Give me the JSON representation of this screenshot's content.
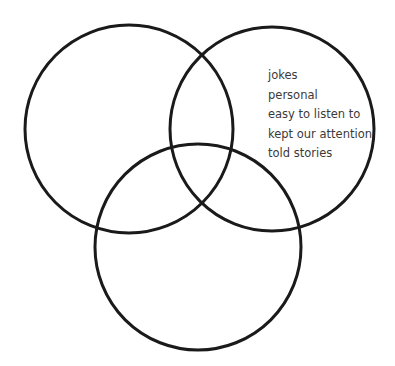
{
  "diagram": {
    "type": "venn",
    "circles": [
      {
        "id": "left",
        "cx": 129,
        "cy": 129,
        "r": 104,
        "labels": []
      },
      {
        "id": "right",
        "cx": 272,
        "cy": 129,
        "r": 102,
        "labels": [
          "jokes",
          "personal",
          "easy to listen to",
          "kept our attention",
          "told stories"
        ]
      },
      {
        "id": "bottom",
        "cx": 198,
        "cy": 247,
        "r": 103,
        "labels": []
      }
    ],
    "stroke_color": "#1a1a1a",
    "text_color": "#3a3a3a"
  },
  "right_circle_items": [
    "jokes",
    "personal",
    "easy to listen to",
    "kept our attention",
    "told stories"
  ]
}
